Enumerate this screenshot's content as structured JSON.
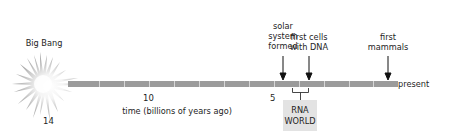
{
  "diagram": {
    "type": "timeline",
    "axis_label": "time (billions of years ago)",
    "ticks": [
      {
        "value": "14",
        "x": 48
      },
      {
        "value": "10",
        "x": 148
      },
      {
        "value": "5",
        "x": 274
      }
    ],
    "end_label": "present",
    "start_event": {
      "label": "Big Bang",
      "icon": "starburst-icon"
    },
    "events": [
      {
        "id": "solar-system",
        "lines": [
          "solar",
          "system",
          "formed"
        ],
        "x": 283
      },
      {
        "id": "first-cells",
        "lines": [
          "first cells",
          "with DNA"
        ],
        "x": 309
      },
      {
        "id": "first-mammals",
        "lines": [
          "first",
          "mammals"
        ],
        "x": 388
      }
    ],
    "range_annotation": {
      "lines": [
        "RNA",
        "WORLD"
      ],
      "from_x": 292,
      "to_x": 308
    },
    "colors": {
      "bar": "#9b9b9b",
      "bar_divider": "#d6d6d6",
      "starburst": "#a8a8a8",
      "box": "#e3e3e3",
      "text": "#1e1e1e"
    }
  }
}
